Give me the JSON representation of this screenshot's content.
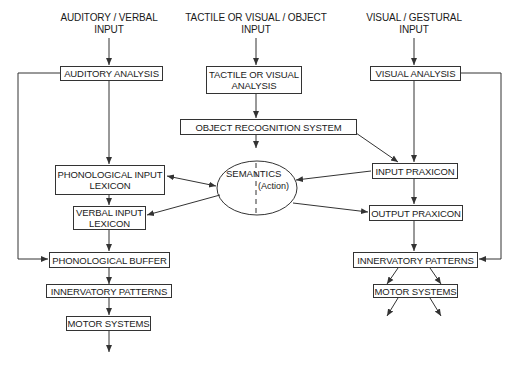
{
  "inputs": {
    "auditory": "AUDITORY / VERBAL\nINPUT",
    "object": "TACTILE OR VISUAL / OBJECT\nINPUT",
    "gestural": "VISUAL / GESTURAL\nINPUT"
  },
  "boxes": {
    "auditory_analysis": "AUDITORY ANALYSIS",
    "tactile_visual_analysis": "TACTILE OR VISUAL\nANALYSIS",
    "visual_analysis": "VISUAL ANALYSIS",
    "object_recognition": "OBJECT RECOGNITION SYSTEM",
    "phonological_input_lexicon": "PHONOLOGICAL INPUT\nLEXICON",
    "verbal_input_lexicon": "VERBAL INPUT\nLEXICON",
    "input_praxicon": "INPUT PRAXICON",
    "output_praxicon": "OUTPUT PRAXICON",
    "phonological_buffer": "PHONOLOGICAL BUFFER",
    "innervatory_left": "INNERVATORY PATTERNS",
    "motor_left": "MOTOR SYSTEMS",
    "innervatory_right": "INNERVATORY PATTERNS",
    "motor_right": "MOTOR SYSTEMS"
  },
  "semantics": {
    "label": "SEMANTICS",
    "sublabel": "(Action)"
  },
  "colors": {
    "line": "#333333",
    "background": "#ffffff"
  }
}
